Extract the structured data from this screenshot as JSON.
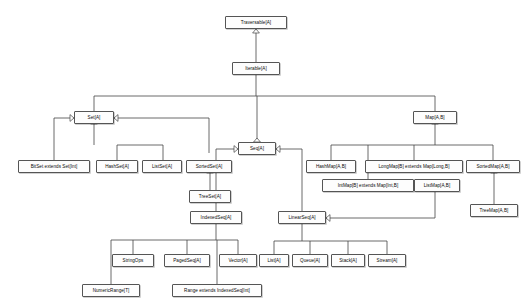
{
  "diagram": {
    "type": "uml-class-hierarchy",
    "background_color": "#ffffff",
    "node_fill_color": "#fdfdfd",
    "node_border_color": "#555555",
    "edge_color": "#444444",
    "text_color": "#0a0a0a",
    "arrowhead_style": "hollow-triangle-generalization"
  },
  "nodes": [
    {
      "id": "traversable",
      "label": "Traversable[A]",
      "x": 225,
      "y": 16,
      "w": 62
    },
    {
      "id": "iterable",
      "label": "Iterable[A]",
      "x": 232,
      "y": 62,
      "w": 48
    },
    {
      "id": "set",
      "label": "Set[A]",
      "x": 74,
      "y": 111,
      "w": 40
    },
    {
      "id": "seq",
      "label": "Seq[A]",
      "x": 238,
      "y": 142,
      "w": 38
    },
    {
      "id": "map",
      "label": "Map[A,B]",
      "x": 413,
      "y": 111,
      "w": 44
    },
    {
      "id": "bitset",
      "label": "BitSet extends Set[Int]",
      "x": 18,
      "y": 160,
      "w": 72
    },
    {
      "id": "hashset",
      "label": "HashSet[A]",
      "x": 96,
      "y": 160,
      "w": 42
    },
    {
      "id": "listset",
      "label": "ListSet[A]",
      "x": 142,
      "y": 160,
      "w": 40
    },
    {
      "id": "sortedset",
      "label": "SortedSet[A]",
      "x": 186,
      "y": 160,
      "w": 46
    },
    {
      "id": "treeset",
      "label": "TreeSet[A]",
      "x": 189,
      "y": 190,
      "w": 42
    },
    {
      "id": "indexedseq",
      "label": "IndexedSeq[A]",
      "x": 190,
      "y": 211,
      "w": 52
    },
    {
      "id": "linearseq",
      "label": "LinearSeq[A]",
      "x": 278,
      "y": 211,
      "w": 48
    },
    {
      "id": "stringops",
      "label": "StringOps",
      "x": 112,
      "y": 254,
      "w": 42
    },
    {
      "id": "pagedseq",
      "label": "PagedSeq[A]",
      "x": 164,
      "y": 254,
      "w": 46
    },
    {
      "id": "vector",
      "label": "Vector[A]",
      "x": 219,
      "y": 254,
      "w": 38
    },
    {
      "id": "numericrange",
      "label": "NumericRange[T]",
      "x": 82,
      "y": 284,
      "w": 58
    },
    {
      "id": "range",
      "label": "Range extends IndexedSeq[Int]",
      "x": 172,
      "y": 284,
      "w": 90
    },
    {
      "id": "list",
      "label": "List[A]",
      "x": 259,
      "y": 254,
      "w": 30
    },
    {
      "id": "queue",
      "label": "Queue[A]",
      "x": 292,
      "y": 254,
      "w": 36
    },
    {
      "id": "stack",
      "label": "Stack[A]",
      "x": 331,
      "y": 254,
      "w": 34
    },
    {
      "id": "stream",
      "label": "Stream[A]",
      "x": 368,
      "y": 254,
      "w": 38
    },
    {
      "id": "hashmap",
      "label": "HashMap[A,B]",
      "x": 306,
      "y": 160,
      "w": 50
    },
    {
      "id": "longmap",
      "label": "LongMap[B] extends Map[Long,B]",
      "x": 365,
      "y": 160,
      "w": 98
    },
    {
      "id": "intmap",
      "label": "IntMap[B] extends Map[Int,B]",
      "x": 322,
      "y": 179,
      "w": 92
    },
    {
      "id": "listmap",
      "label": "ListMap[A,B]",
      "x": 414,
      "y": 179,
      "w": 46
    },
    {
      "id": "sortedmap",
      "label": "SortedMap[A,B]",
      "x": 466,
      "y": 160,
      "w": 54
    },
    {
      "id": "treemap",
      "label": "TreeMap[A,B]",
      "x": 470,
      "y": 204,
      "w": 48
    }
  ],
  "edges": [
    {
      "from": "iterable",
      "to": "traversable",
      "relation": "extends"
    },
    {
      "from": "set",
      "to": "iterable",
      "relation": "extends"
    },
    {
      "from": "seq",
      "to": "iterable",
      "relation": "extends"
    },
    {
      "from": "map",
      "to": "iterable",
      "relation": "extends"
    },
    {
      "from": "bitset",
      "to": "set",
      "relation": "extends"
    },
    {
      "from": "hashset",
      "to": "set",
      "relation": "extends"
    },
    {
      "from": "listset",
      "to": "set",
      "relation": "extends"
    },
    {
      "from": "sortedset",
      "to": "set",
      "relation": "extends"
    },
    {
      "from": "treeset",
      "to": "sortedset",
      "relation": "extends"
    },
    {
      "from": "indexedseq",
      "to": "seq",
      "relation": "extends"
    },
    {
      "from": "linearseq",
      "to": "seq",
      "relation": "extends"
    },
    {
      "from": "stringops",
      "to": "indexedseq",
      "relation": "extends"
    },
    {
      "from": "pagedseq",
      "to": "indexedseq",
      "relation": "extends"
    },
    {
      "from": "vector",
      "to": "indexedseq",
      "relation": "extends"
    },
    {
      "from": "numericrange",
      "to": "indexedseq",
      "relation": "extends"
    },
    {
      "from": "range",
      "to": "indexedseq",
      "relation": "extends"
    },
    {
      "from": "list",
      "to": "linearseq",
      "relation": "extends"
    },
    {
      "from": "queue",
      "to": "linearseq",
      "relation": "extends"
    },
    {
      "from": "stack",
      "to": "linearseq",
      "relation": "extends"
    },
    {
      "from": "stream",
      "to": "linearseq",
      "relation": "extends"
    },
    {
      "from": "hashmap",
      "to": "map",
      "relation": "extends"
    },
    {
      "from": "intmap",
      "to": "map",
      "relation": "extends"
    },
    {
      "from": "longmap",
      "to": "map",
      "relation": "extends"
    },
    {
      "from": "listmap",
      "to": "map",
      "relation": "extends"
    },
    {
      "from": "sortedmap",
      "to": "map",
      "relation": "extends"
    },
    {
      "from": "treemap",
      "to": "sortedmap",
      "relation": "extends"
    }
  ],
  "edge_paths": [
    {
      "name": "iterable-to-traversable",
      "d": "M 256 62 L 256 33",
      "arrow": "up",
      "ax": 256,
      "ay": 33
    },
    {
      "name": "iterable-bus-down",
      "d": "M 256 75 L 256 96",
      "arrow": "none"
    },
    {
      "name": "iterable-bus",
      "d": "M 94 96 L 435 96",
      "arrow": "none"
    },
    {
      "name": "bus-to-set",
      "d": "M 94 96 L 94 124",
      "arrow": "up",
      "ax": 94,
      "ay": 124
    },
    {
      "name": "bus-to-seq",
      "d": "M 257 96 L 257 142",
      "arrow": "up",
      "ax": 257,
      "ay": 142
    },
    {
      "name": "bus-to-map",
      "d": "M 435 96 L 435 124",
      "arrow": "up",
      "ax": 435,
      "ay": 124
    },
    {
      "name": "bitset-to-set",
      "d": "M 54 160 L 54 118 L 74 118",
      "arrow": "right",
      "ax": 74,
      "ay": 118
    },
    {
      "name": "set-children-bus-drop",
      "d": "M 94 124 L 94 145",
      "arrow": "none"
    },
    {
      "name": "set-children-bus",
      "d": "M 117 145 L 163 145",
      "arrow": "none"
    },
    {
      "name": "hashset-to-bus",
      "d": "M 117 160 L 117 145",
      "arrow": "none"
    },
    {
      "name": "listset-to-bus",
      "d": "M 163 160 L 163 145",
      "arrow": "none"
    },
    {
      "name": "sortedset-to-set",
      "d": "M 209 153 L 209 118 L 114 118",
      "arrow": "left",
      "ax": 114,
      "ay": 118
    },
    {
      "name": "treeset-to-sortedset",
      "d": "M 210 190 L 210 173",
      "arrow": "up",
      "ax": 210,
      "ay": 173
    },
    {
      "name": "indexedseq-to-seq",
      "d": "M 216 211 L 216 149 L 238 149",
      "arrow": "right",
      "ax": 238,
      "ay": 149
    },
    {
      "name": "linearseq-to-seq",
      "d": "M 302 211 L 302 149 L 276 149",
      "arrow": "left",
      "ax": 276,
      "ay": 149
    },
    {
      "name": "indexedseq-children-drop",
      "d": "M 216 224 L 216 240",
      "arrow": "none"
    },
    {
      "name": "indexedseq-children-bus",
      "d": "M 111 240 L 238 240",
      "arrow": "none"
    },
    {
      "name": "stringops-to-bus",
      "d": "M 133 254 L 133 240",
      "arrow": "none"
    },
    {
      "name": "pagedseq-to-bus",
      "d": "M 187 254 L 187 240",
      "arrow": "none"
    },
    {
      "name": "vector-to-bus",
      "d": "M 238 254 L 238 240",
      "arrow": "none"
    },
    {
      "name": "numericrange-to-bus",
      "d": "M 111 284 L 111 240",
      "arrow": "none"
    },
    {
      "name": "range-to-bus",
      "d": "M 217 284 L 217 240",
      "arrow": "none"
    },
    {
      "name": "linearseq-children-drop",
      "d": "M 302 224 L 302 241",
      "arrow": "none"
    },
    {
      "name": "linearseq-children-bus",
      "d": "M 274 241 L 387 241",
      "arrow": "none"
    },
    {
      "name": "list-to-bus",
      "d": "M 274 254 L 274 241",
      "arrow": "none"
    },
    {
      "name": "queue-to-bus",
      "d": "M 310 254 L 310 241",
      "arrow": "none"
    },
    {
      "name": "stack-to-bus",
      "d": "M 348 254 L 348 241",
      "arrow": "none"
    },
    {
      "name": "stream-to-bus",
      "d": "M 387 254 L 387 241",
      "arrow": "none"
    },
    {
      "name": "listmap-to-linearseq",
      "d": "M 435 192 L 435 218 L 326 218",
      "arrow": "left",
      "ax": 326,
      "ay": 218
    },
    {
      "name": "map-children-drop",
      "d": "M 435 124 L 435 145",
      "arrow": "none"
    },
    {
      "name": "map-children-bus",
      "d": "M 331 145 L 493 145",
      "arrow": "none"
    },
    {
      "name": "hashmap-to-bus",
      "d": "M 331 160 L 331 145",
      "arrow": "none"
    },
    {
      "name": "intmap-to-bus",
      "d": "M 368 179 L 368 145",
      "arrow": "none"
    },
    {
      "name": "longmap-to-bus",
      "d": "M 414 160 L 414 145",
      "arrow": "none"
    },
    {
      "name": "sortedmap-to-bus",
      "d": "M 493 160 L 493 145",
      "arrow": "none"
    },
    {
      "name": "treemap-to-sortedmap",
      "d": "M 494 204 L 494 173",
      "arrow": "up",
      "ax": 494,
      "ay": 173
    }
  ]
}
